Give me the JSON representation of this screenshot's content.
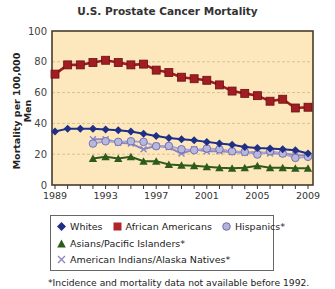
{
  "chart_data": {
    "type": "line",
    "title": "U.S. Prostate Cancer Mortality",
    "xlabel": "",
    "ylabel": "Mortality per 100,000 Men",
    "ylim": [
      0,
      100
    ],
    "xlim": [
      1989,
      2009
    ],
    "yticks": [
      0,
      20,
      40,
      60,
      80,
      100
    ],
    "xticks": [
      1989,
      1993,
      1997,
      2001,
      2005,
      2009
    ],
    "grid": "horizontal dashed",
    "legend_position": "below",
    "x": [
      1989,
      1990,
      1991,
      1992,
      1993,
      1994,
      1995,
      1996,
      1997,
      1998,
      1999,
      2000,
      2001,
      2002,
      2003,
      2004,
      2005,
      2006,
      2007,
      2008,
      2009
    ],
    "series": [
      {
        "name": "Whites",
        "marker": "diamond",
        "color": "#1f2f86",
        "values": [
          34.8,
          36.6,
          36.6,
          36.6,
          36.1,
          35.5,
          34.8,
          33.3,
          31.8,
          30.5,
          29.7,
          29.0,
          28.0,
          26.9,
          26.2,
          24.7,
          24.1,
          23.7,
          23.2,
          22.6,
          20.4
        ]
      },
      {
        "name": "African Americans",
        "marker": "square",
        "color": "#9b1b1e",
        "values": [
          72,
          78,
          78,
          79.5,
          81,
          79.5,
          78,
          78.5,
          74.6,
          73,
          70,
          69,
          68,
          65,
          61,
          59.5,
          58,
          54.4,
          55.7,
          50,
          50.5
        ]
      },
      {
        "name": "Hispanics*",
        "marker": "circle",
        "color": "#a7a6d6",
        "values": [
          null,
          null,
          null,
          26.9,
          28.4,
          28,
          28.4,
          28,
          25.2,
          25.4,
          23.2,
          22.6,
          23.7,
          23.2,
          21.9,
          21.5,
          19.8,
          21.9,
          20.4,
          17.6,
          18.3
        ]
      },
      {
        "name": "Asians/Pacific Islanders*",
        "marker": "triangle",
        "color": "#2f5a1e",
        "values": [
          null,
          null,
          null,
          17.2,
          18.3,
          17.2,
          18.3,
          15.5,
          15.5,
          13.3,
          12.9,
          12.5,
          11.8,
          11.2,
          10.8,
          11.2,
          12.5,
          11.2,
          11.2,
          10.8,
          10.8
        ]
      },
      {
        "name": "American Indians/Alaska Natives*",
        "marker": "x",
        "color": "#8e86c2",
        "values": [
          null,
          null,
          null,
          29.7,
          29.7,
          27.5,
          26.9,
          23.2,
          25.4,
          24.5,
          20.4,
          23.2,
          21.9,
          21.9,
          21.5,
          21.0,
          21.5,
          20.5,
          20.5,
          19.5,
          19.0
        ]
      }
    ],
    "footnote": "*Incidence and mortality data not available before 1992."
  },
  "colors": {
    "plot_background": "#fde8bd",
    "plot_border": "#4a3b2c",
    "gridline": "#d9bf93"
  },
  "legend": {
    "row1": [
      "Whites",
      "African Americans",
      "Hispanics*"
    ],
    "row2": [
      "Asians/Pacific Islanders*"
    ],
    "row3": [
      "American Indians/Alaska Natives*"
    ]
  }
}
